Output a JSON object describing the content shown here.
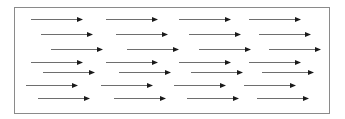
{
  "diagram": {
    "title": "",
    "frame": {
      "x": 14,
      "y": 7,
      "width": 316,
      "height": 107,
      "border_color": "#8a8a8a"
    },
    "arrow_style": {
      "line_color": "#6e6e6e",
      "head_color": "#1a1a1a",
      "line_width": 1,
      "length": 52,
      "head_length": 6,
      "head_half_width": 2.5
    },
    "rows": [
      {
        "y": 19,
        "x_starts": [
          31,
          106,
          179,
          249
        ]
      },
      {
        "y": 34,
        "x_starts": [
          41,
          116,
          189,
          259
        ]
      },
      {
        "y": 49,
        "x_starts": [
          51,
          127,
          199,
          269
        ]
      },
      {
        "y": 62,
        "x_starts": [
          31,
          106,
          179,
          249
        ]
      },
      {
        "y": 72,
        "x_starts": [
          43,
          119,
          191,
          262
        ]
      },
      {
        "y": 85,
        "x_starts": [
          26,
          101,
          174,
          244
        ]
      },
      {
        "y": 98,
        "x_starts": [
          38,
          114,
          187,
          257
        ]
      }
    ],
    "direction": "right"
  }
}
